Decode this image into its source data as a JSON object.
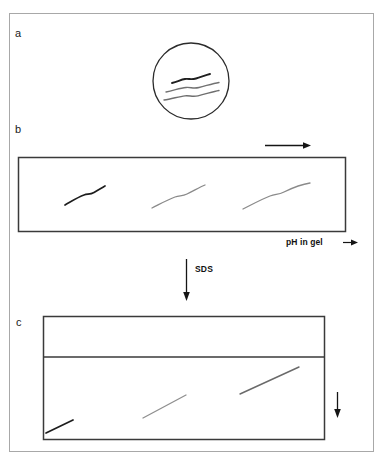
{
  "figure": {
    "frame": {
      "stroke": "#9a9a9a",
      "fill": "#ffffff"
    },
    "ink": {
      "dark": "#1a1a1a",
      "mid": "#6f6f6f",
      "light": "#8d8d8d",
      "box": "#3a3a3a"
    }
  },
  "panels": {
    "a": {
      "label": "a",
      "caption_icon": "cell-circle-icon",
      "circle": {
        "cx": 191,
        "cy": 81,
        "r": 38
      },
      "bands": [
        {
          "name": "band-top",
          "tone": "dark",
          "width": 1.9
        },
        {
          "name": "band-middle",
          "tone": "mid",
          "width": 1.4
        },
        {
          "name": "band-bottom",
          "tone": "mid",
          "width": 1.4
        }
      ]
    },
    "b": {
      "label": "b",
      "direction_arrow": "right-arrow-icon",
      "axis_label": "pH in gel",
      "axis_arrow": "right-arrow-icon",
      "gel_box": {
        "x": 18,
        "y": 157,
        "w": 328,
        "h": 75
      },
      "streaks": [
        {
          "name": "streak-1",
          "tone": "dark"
        },
        {
          "name": "streak-2",
          "tone": "light"
        },
        {
          "name": "streak-3",
          "tone": "light"
        }
      ]
    },
    "transition": {
      "label": "SDS",
      "arrow": "down-arrow-icon"
    },
    "c": {
      "label": "c",
      "gel_box": {
        "x": 43,
        "y": 316,
        "w": 282,
        "h": 124
      },
      "stacking_divider_y": 357,
      "direction_arrow": "down-arrow-icon",
      "streaks": [
        {
          "name": "streak-1",
          "tone": "dark"
        },
        {
          "name": "streak-2",
          "tone": "light"
        },
        {
          "name": "streak-3",
          "tone": "mid"
        }
      ]
    }
  }
}
